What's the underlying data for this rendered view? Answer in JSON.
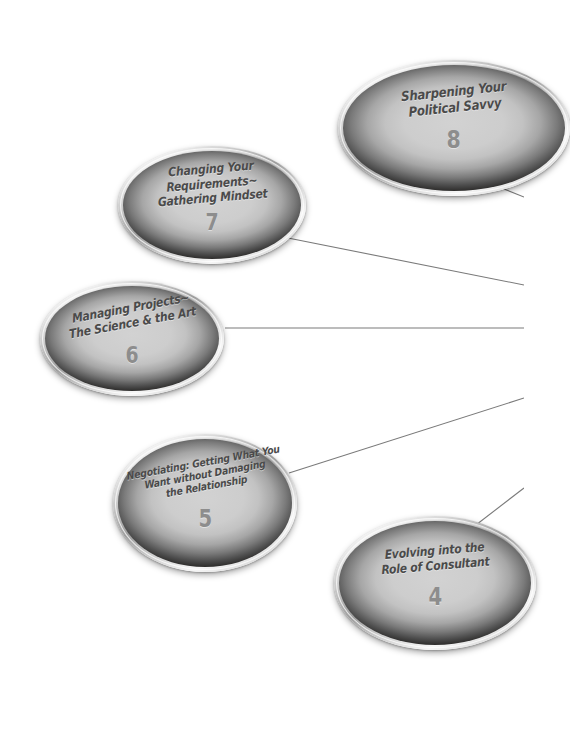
{
  "diagram": {
    "type": "node-link-map",
    "background_color": "#ffffff",
    "node_fill_color": "#c9c9c9",
    "node_edge_color": "#211f1e",
    "node_rim_color": "#d8d8d8",
    "title_text_color": "#4a4a4a",
    "number_text_color": "#8d8d8d",
    "connector_color": "#7a7a7a",
    "nodes": [
      {
        "id": "node-8",
        "number": "8",
        "title_lines": [
          "Sharpening Your",
          "Political Savvy"
        ]
      },
      {
        "id": "node-7",
        "number": "7",
        "title_lines": [
          "Changing Your",
          "Requirements~",
          "Gathering Mindset"
        ]
      },
      {
        "id": "node-6",
        "number": "6",
        "title_lines": [
          "Managing Projects~",
          "The Science & the Art"
        ]
      },
      {
        "id": "node-5",
        "number": "5",
        "title_lines": [
          "Negotiating: Getting What You",
          "Want without Damaging",
          "the Relationship"
        ]
      },
      {
        "id": "node-4",
        "number": "4",
        "title_lines": [
          "Evolving into the",
          "Role of Consultant"
        ]
      }
    ],
    "connectors": [
      {
        "id": "connector-from-node-8",
        "from": "node-8",
        "x1": 489,
        "y1": 183,
        "x2": 524,
        "y2": 197
      },
      {
        "id": "connector-from-node-7",
        "from": "node-7",
        "x1": 288,
        "y1": 238,
        "x2": 524,
        "y2": 285
      },
      {
        "id": "connector-from-node-6",
        "from": "node-6",
        "x1": 225,
        "y1": 328,
        "x2": 524,
        "y2": 328
      },
      {
        "id": "connector-from-node-5",
        "from": "node-5",
        "x1": 289,
        "y1": 473,
        "x2": 524,
        "y2": 398
      },
      {
        "id": "connector-from-node-4",
        "from": "node-4",
        "x1": 472,
        "y1": 528,
        "x2": 524,
        "y2": 488
      }
    ]
  }
}
